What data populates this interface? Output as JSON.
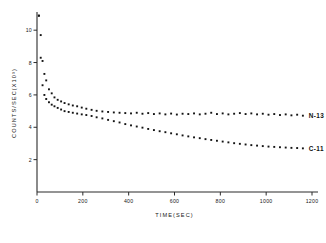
{
  "chart_data": {
    "type": "scatter",
    "title": "",
    "xlabel": "TIME(SEC)",
    "ylabel": "COUNTS/SEC(X10³)",
    "xlim": [
      0,
      1200
    ],
    "ylim": [
      0,
      11
    ],
    "grid": false,
    "legend_position": "right-of-curve-end",
    "xticks": [
      "0",
      "200",
      "400",
      "600",
      "800",
      "1000",
      "1200"
    ],
    "xtick_values": [
      0,
      200,
      400,
      600,
      800,
      1000,
      1200
    ],
    "yticks": [
      "2",
      "4",
      "6",
      "8",
      "10"
    ],
    "ytick_values": [
      2,
      4,
      6,
      8,
      10
    ],
    "series": [
      {
        "name": "N-13",
        "label": "N-13",
        "color": "#141414",
        "marker": "square",
        "x": [
          8,
          16,
          24,
          32,
          40,
          52,
          64,
          76,
          90,
          105,
          120,
          138,
          156,
          175,
          195,
          215,
          238,
          260,
          285,
          310,
          335,
          360,
          385,
          410,
          435,
          460,
          485,
          510,
          535,
          560,
          585,
          610,
          635,
          660,
          685,
          710,
          735,
          760,
          785,
          810,
          835,
          860,
          885,
          910,
          935,
          960,
          985,
          1010,
          1035,
          1060,
          1085,
          1110,
          1135,
          1160
        ],
        "y": [
          10.9,
          9.7,
          8.1,
          7.3,
          6.9,
          6.35,
          6.1,
          5.85,
          5.7,
          5.6,
          5.5,
          5.42,
          5.35,
          5.3,
          5.22,
          5.15,
          5.08,
          5.02,
          4.98,
          4.95,
          4.92,
          4.9,
          4.88,
          4.86,
          4.9,
          4.84,
          4.88,
          4.82,
          4.86,
          4.8,
          4.85,
          4.79,
          4.84,
          4.82,
          4.86,
          4.8,
          4.84,
          4.9,
          4.82,
          4.86,
          4.8,
          4.84,
          4.88,
          4.82,
          4.86,
          4.8,
          4.84,
          4.78,
          4.82,
          4.76,
          4.8,
          4.74,
          4.78,
          4.72
        ]
      },
      {
        "name": "C-11",
        "label": "C-11",
        "color": "#141414",
        "marker": "square",
        "x": [
          8,
          16,
          24,
          32,
          40,
          52,
          64,
          76,
          90,
          105,
          120,
          138,
          156,
          175,
          195,
          215,
          238,
          260,
          285,
          310,
          335,
          360,
          385,
          410,
          435,
          460,
          485,
          510,
          535,
          560,
          585,
          610,
          635,
          660,
          685,
          710,
          735,
          760,
          785,
          810,
          835,
          860,
          885,
          910,
          935,
          960,
          985,
          1010,
          1035,
          1060,
          1085,
          1110,
          1135,
          1160
        ],
        "y": [
          10.9,
          8.3,
          6.6,
          6.0,
          5.75,
          5.55,
          5.4,
          5.3,
          5.2,
          5.1,
          5.0,
          4.95,
          4.9,
          4.85,
          4.8,
          4.76,
          4.7,
          4.62,
          4.55,
          4.46,
          4.38,
          4.3,
          4.2,
          4.12,
          4.05,
          3.98,
          3.9,
          3.83,
          3.76,
          3.7,
          3.63,
          3.57,
          3.5,
          3.44,
          3.38,
          3.33,
          3.27,
          3.22,
          3.17,
          3.12,
          3.07,
          3.02,
          2.98,
          2.94,
          2.9,
          2.87,
          2.84,
          2.81,
          2.79,
          2.77,
          2.75,
          2.73,
          2.72,
          2.7
        ]
      }
    ]
  }
}
